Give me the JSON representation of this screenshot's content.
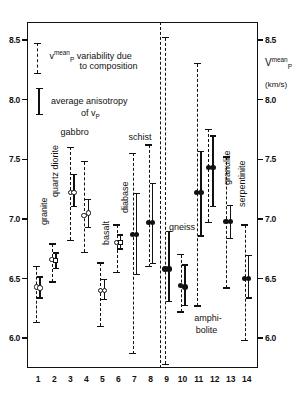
{
  "chart_data": {
    "type": "scatter",
    "title": "",
    "xlabel": "",
    "ylabel": "Vp mean (km/s)",
    "ylim": [
      5.75,
      8.65
    ],
    "xlim": [
      0.3,
      14.7
    ],
    "yticks": [
      6.0,
      6.5,
      7.0,
      7.5,
      8.0,
      8.5
    ],
    "ytick_labels": [
      "6.0",
      "6.5",
      "7.0",
      "7.5",
      "8.0",
      "8.5"
    ],
    "xticks": [
      1,
      2,
      3,
      4,
      5,
      6,
      7,
      8,
      9,
      10,
      11,
      12,
      13,
      14
    ],
    "xtick_labels": [
      "1",
      "2",
      "3",
      "4",
      "5",
      "6",
      "7",
      "8",
      "9",
      "10",
      "11",
      "12",
      "13",
      "14"
    ],
    "grid": false,
    "legend_position": "upper-left",
    "axis_color": "#111111",
    "series": [
      {
        "name": "granite",
        "x": 1,
        "marker": "circle-open",
        "points": [
          {
            "x": 0.88,
            "mean": 6.43,
            "var_low": 6.13,
            "var_high": 6.6,
            "aniso_low": null,
            "aniso_high": null
          },
          {
            "x": 1.12,
            "mean": 6.42,
            "var_low": null,
            "var_high": null,
            "aniso_low": 6.33,
            "aniso_high": 6.52
          }
        ]
      },
      {
        "name": "quartz diorite",
        "x": 2,
        "marker": "circle-open",
        "points": [
          {
            "x": 1.85,
            "mean": 6.66,
            "var_low": 6.47,
            "var_high": 6.79,
            "aniso_low": null,
            "aniso_high": null
          },
          {
            "x": 2.1,
            "mean": 6.65,
            "var_low": null,
            "var_high": null,
            "aniso_low": 6.58,
            "aniso_high": 6.72,
            "marker": "square-open"
          }
        ]
      },
      {
        "name": "gabbro",
        "x": 3,
        "marker": "circle-open",
        "points": [
          {
            "x": 3.0,
            "mean": 7.22,
            "var_low": 6.82,
            "var_high": 7.6,
            "aniso_low": null,
            "aniso_high": null
          },
          {
            "x": 3.22,
            "mean": 7.22,
            "var_low": null,
            "var_high": null,
            "aniso_low": 7.1,
            "aniso_high": 7.38
          }
        ]
      },
      {
        "name": "gabbro-2",
        "x": 4,
        "marker": "circle-open",
        "points": [
          {
            "x": 3.85,
            "mean": 7.03,
            "var_low": 6.72,
            "var_high": 7.48,
            "aniso_low": null,
            "aniso_high": null
          },
          {
            "x": 4.12,
            "mean": 7.05,
            "var_low": null,
            "var_high": null,
            "aniso_low": 6.92,
            "aniso_high": 7.17
          }
        ]
      },
      {
        "name": "basalt",
        "x": 5,
        "marker": "circle-open",
        "points": [
          {
            "x": 4.88,
            "mean": 6.4,
            "var_low": 6.1,
            "var_high": 6.63,
            "aniso_low": null,
            "aniso_high": null
          },
          {
            "x": 5.12,
            "mean": 6.4,
            "var_low": null,
            "var_high": null,
            "aniso_low": 6.32,
            "aniso_high": 6.5
          }
        ]
      },
      {
        "name": "diabase",
        "x": 6,
        "marker": "circle-open",
        "points": [
          {
            "x": 5.88,
            "mean": 6.8,
            "var_low": 6.55,
            "var_high": 6.95,
            "aniso_low": null,
            "aniso_high": null
          },
          {
            "x": 6.12,
            "mean": 6.8,
            "var_low": null,
            "var_high": null,
            "aniso_low": 6.74,
            "aniso_high": 6.87,
            "marker": "square-open"
          }
        ]
      },
      {
        "name": "schist",
        "x": 7,
        "marker": "circle-fill",
        "points": [
          {
            "x": 6.88,
            "mean": 6.87,
            "var_low": 5.87,
            "var_high": 7.55,
            "aniso_low": null,
            "aniso_high": null
          },
          {
            "x": 7.14,
            "mean": 6.87,
            "var_low": null,
            "var_high": null,
            "aniso_low": 6.53,
            "aniso_high": 7.22
          }
        ]
      },
      {
        "name": "schist-2",
        "x": 8,
        "marker": "circle-fill",
        "points": [
          {
            "x": 7.88,
            "mean": 6.97,
            "var_low": 6.6,
            "var_high": 7.62,
            "aniso_low": null,
            "aniso_high": null
          },
          {
            "x": 8.14,
            "mean": 6.97,
            "var_low": null,
            "var_high": null,
            "aniso_low": 6.62,
            "aniso_high": 7.3
          }
        ]
      },
      {
        "name": "gneiss",
        "x": 9,
        "marker": "circle-fill",
        "points": [
          {
            "x": 8.9,
            "mean": 6.58,
            "var_low": 5.78,
            "var_high": 8.52,
            "aniso_low": null,
            "aniso_high": null
          },
          {
            "x": 9.16,
            "mean": 6.58,
            "var_low": null,
            "var_high": null,
            "aniso_low": 6.3,
            "aniso_high": 6.9
          }
        ]
      },
      {
        "name": "gneiss-2",
        "x": 10,
        "marker": "circle-fill",
        "points": [
          {
            "x": 9.88,
            "mean": 6.44,
            "var_low": 6.22,
            "var_high": 6.7,
            "aniso_low": null,
            "aniso_high": null
          },
          {
            "x": 10.14,
            "mean": 6.43,
            "var_low": null,
            "var_high": null,
            "aniso_low": 6.27,
            "aniso_high": 6.62
          }
        ]
      },
      {
        "name": "amphibolite",
        "x": 11,
        "marker": "circle-fill",
        "points": [
          {
            "x": 10.88,
            "mean": 7.22,
            "var_low": 6.27,
            "var_high": 8.3,
            "aniso_low": null,
            "aniso_high": null
          },
          {
            "x": 11.14,
            "mean": 7.22,
            "var_low": null,
            "var_high": null,
            "aniso_low": 6.85,
            "aniso_high": 7.57
          }
        ]
      },
      {
        "name": "amphibolite-2",
        "x": 12,
        "marker": "circle-fill",
        "points": [
          {
            "x": 11.6,
            "mean": 7.43,
            "var_low": 6.97,
            "var_high": 7.75,
            "aniso_low": null,
            "aniso_high": null
          },
          {
            "x": 11.9,
            "mean": 7.43,
            "var_low": null,
            "var_high": null,
            "aniso_low": 7.1,
            "aniso_high": 7.7
          }
        ]
      },
      {
        "name": "granulite",
        "x": 13,
        "marker": "circle-fill",
        "points": [
          {
            "x": 12.7,
            "mean": 6.98,
            "var_low": 6.42,
            "var_high": 7.52,
            "aniso_low": null,
            "aniso_high": null
          },
          {
            "x": 12.98,
            "mean": 6.98,
            "var_low": null,
            "var_high": null,
            "aniso_low": 6.83,
            "aniso_high": 7.12
          }
        ]
      },
      {
        "name": "serpentinite",
        "x": 14,
        "marker": "circle-fill",
        "points": [
          {
            "x": 13.86,
            "mean": 6.5,
            "var_low": 5.98,
            "var_high": 6.95,
            "aniso_low": null,
            "aniso_high": null
          },
          {
            "x": 14.12,
            "mean": 6.5,
            "var_low": null,
            "var_high": null,
            "aniso_low": 6.33,
            "aniso_high": 6.7
          }
        ]
      }
    ],
    "rock_labels": [
      {
        "text": "granite",
        "x": 1.05,
        "y": 6.95,
        "orient": "vertical"
      },
      {
        "text": "quartz diorite",
        "x": 1.72,
        "y": 7.18,
        "orient": "vertical"
      },
      {
        "text": "gabbro",
        "x": 2.52,
        "y": 7.72,
        "orient": "horizontal"
      },
      {
        "text": "basalt",
        "x": 4.92,
        "y": 6.78,
        "orient": "vertical"
      },
      {
        "text": "diabase",
        "x": 6.1,
        "y": 7.05,
        "orient": "vertical"
      },
      {
        "text": "schist",
        "x": 6.75,
        "y": 7.68,
        "orient": "horizontal"
      },
      {
        "text": "gneiss",
        "x": 9.28,
        "y": 6.92,
        "orient": "horizontal"
      },
      {
        "text": "amphi-",
        "x": 10.85,
        "y": 6.16,
        "orient": "horizontal"
      },
      {
        "text": "bolite",
        "x": 10.95,
        "y": 6.06,
        "orient": "horizontal"
      },
      {
        "text": "granulite",
        "x": 12.45,
        "y": 7.28,
        "orient": "vertical"
      },
      {
        "text": "serpentinite",
        "x": 13.42,
        "y": 7.1,
        "orient": "vertical"
      }
    ],
    "divider": {
      "x": 8.62,
      "note": "separates igneous from metamorphic rocks"
    },
    "annotations": [
      {
        "id": "legend-variability",
        "line1": "variability due",
        "line2": "to composition",
        "prefix": "v",
        "sup": "mean",
        "sub": "P"
      },
      {
        "id": "legend-anisotropy",
        "line1": "average anisotropy",
        "line2": "of",
        "symbol": "v",
        "symbol_sub": "P"
      }
    ]
  },
  "axis": {
    "y_label_symbol": "V",
    "y_label_sup": "mean",
    "y_label_sub": "P",
    "y_unit": "(km/s)"
  },
  "legend": {
    "variability_line1_symbol": "v",
    "variability_line1_sup": "mean",
    "variability_line1_sub": "P",
    "variability_line1_text": "variability due",
    "variability_line2_text": "to composition",
    "anisotropy_line1_text": "average anisotropy",
    "anisotropy_line2_text": "of",
    "anisotropy_symbol": "v",
    "anisotropy_symbol_sub": "P",
    "variability_bar": {
      "low": 8.22,
      "high": 8.47
    },
    "anisotropy_bar": {
      "low": 7.87,
      "high": 8.1
    }
  }
}
